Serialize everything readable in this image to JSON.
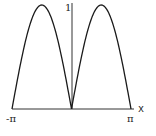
{
  "chart_data": {
    "type": "line",
    "title": "",
    "function": "|sin(x)|",
    "xlabel": "x",
    "ylabel": "",
    "xlim": [
      -3.14159,
      3.14159
    ],
    "ylim": [
      0,
      1
    ],
    "x_tick_labels": [
      "-π",
      "π"
    ],
    "y_tick_labels": [
      "1"
    ],
    "grid": false,
    "legend": null,
    "series": [
      {
        "name": "|sin x|",
        "x": [
          -3.1416,
          -2.3562,
          -1.5708,
          -0.7854,
          0,
          0.7854,
          1.5708,
          2.3562,
          3.1416
        ],
        "values": [
          0,
          0.7071,
          1,
          0.7071,
          0,
          0.7071,
          1,
          0.7071,
          0
        ]
      }
    ]
  },
  "labels": {
    "x_axis": "x",
    "y_max": "1",
    "x_min": "-π",
    "x_max": "π"
  },
  "colors": {
    "curve": "#1a1a1a",
    "axis": "#333333"
  }
}
